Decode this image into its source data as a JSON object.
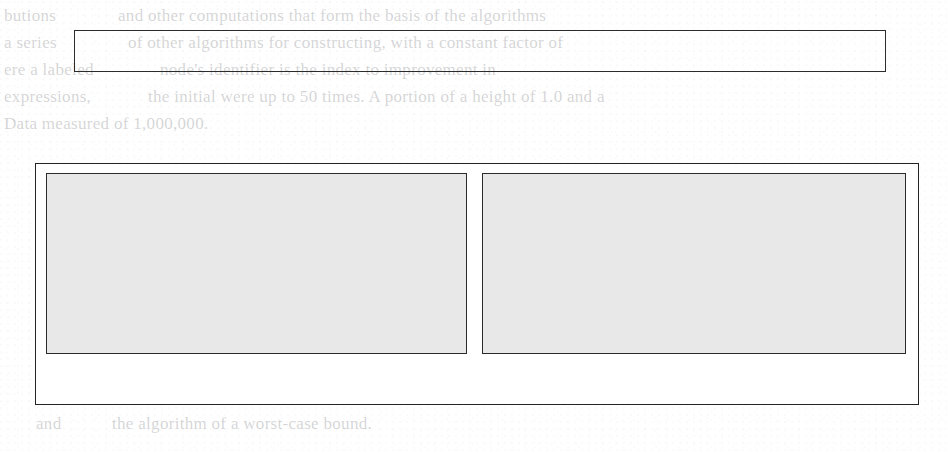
{
  "figure": {
    "top_array": {
      "name": "sequence-array",
      "cell_count": 18,
      "cells": [
        "",
        "",
        "",
        "",
        "X",
        "",
        "",
        "",
        "",
        "",
        "",
        "",
        "Y",
        "",
        "",
        "",
        "",
        ""
      ],
      "x_label": "X",
      "y_label": "Y",
      "x_index_label": "i",
      "y_index_label": "j"
    },
    "panels": [
      {
        "id": "panel-m",
        "caption_base": "μ",
        "caption_sub": "M",
        "row_count": 3,
        "cell_count": 18,
        "rows": [
          [
            "",
            "",
            "",
            "",
            "X",
            "",
            "",
            "",
            "",
            "",
            "",
            "",
            "Y",
            "",
            "",
            "",
            "",
            ""
          ],
          [
            "",
            "",
            "",
            "",
            "X",
            "",
            "",
            "",
            "",
            "",
            "",
            "",
            "Y",
            "",
            "",
            "",
            "",
            ""
          ],
          [
            "",
            "",
            "",
            "",
            "X",
            "",
            "",
            "",
            "",
            "",
            "",
            "",
            "Y",
            "",
            "",
            "",
            "",
            ""
          ]
        ]
      },
      {
        "id": "panel-r",
        "caption_base": "μ",
        "caption_sub": "R",
        "row_count": 4,
        "cell_count": 18,
        "rows": [
          [
            "",
            "",
            "",
            "",
            "Y",
            "",
            "",
            "",
            "",
            "",
            "",
            "",
            "X",
            "",
            "",
            "",
            "",
            ""
          ],
          [
            "",
            "",
            "",
            "",
            "Y",
            "",
            "",
            "",
            "",
            "",
            "",
            "",
            "X",
            "",
            "",
            "",
            "",
            ""
          ],
          [
            "",
            "",
            "",
            "",
            "Y",
            "",
            "",
            "",
            "",
            "",
            "",
            "",
            "X",
            "",
            "",
            "",
            "",
            ""
          ],
          [
            "",
            "",
            "",
            "",
            "Y",
            "",
            "",
            "",
            "",
            "",
            "",
            "",
            "X",
            "",
            "",
            "",
            "",
            ""
          ]
        ]
      }
    ],
    "colors": {
      "panel_fill": "#e8e8e8",
      "line": "#2b2b2b",
      "page": "#ffffff"
    }
  },
  "background_text": {
    "lines": [
      "butions",
      "a series of other algorithms for constructing",
      "where a labeled node's identifier is the index",
      "expressions, the initial were up to 50 times",
      "Data measured of 1,000,000."
    ]
  }
}
